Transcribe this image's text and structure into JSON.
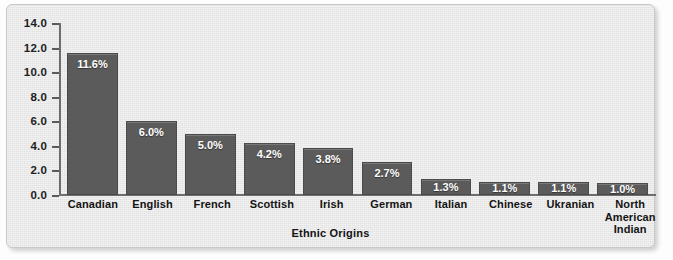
{
  "chart_data": {
    "type": "bar",
    "title": "",
    "xlabel": "Ethnic Origins",
    "ylabel": "",
    "ylim": [
      0.0,
      14.0
    ],
    "ytick_step": 2.0,
    "yticks": [
      "14.0",
      "12.0",
      "10.0",
      "8.0",
      "6.0",
      "4.0",
      "2.0",
      "0.0"
    ],
    "grid": false,
    "legend": "none",
    "value_label_suffix": "%",
    "categories": [
      "Canadian",
      "English",
      "French",
      "Scottish",
      "Irish",
      "German",
      "Italian",
      "Chinese",
      "Ukranian",
      "North American Indian"
    ],
    "category_lines": [
      [
        "Canadian"
      ],
      [
        "English"
      ],
      [
        "French"
      ],
      [
        "Scottish"
      ],
      [
        "Irish"
      ],
      [
        "German"
      ],
      [
        "Italian"
      ],
      [
        "Chinese"
      ],
      [
        "Ukranian"
      ],
      [
        "North",
        "American",
        "Indian"
      ]
    ],
    "values": [
      11.6,
      6.0,
      5.0,
      4.2,
      3.8,
      2.7,
      1.3,
      1.1,
      1.1,
      1.0
    ],
    "value_labels": [
      "11.6%",
      "6.0%",
      "5.0%",
      "4.2%",
      "3.8%",
      "2.7%",
      "1.3%",
      "1.1%",
      "1.1%",
      "1.0%"
    ],
    "colors": {
      "bar_fill": "#5b5b5b",
      "bar_stroke": "#4a4a4a",
      "panel_background": "#e9e9e9",
      "panel_border": "#c8c8c8",
      "axis_line": "#6d6d6d",
      "text": "#141414",
      "value_label_text": "#ffffff",
      "page_background": "#fdfdfd"
    }
  }
}
